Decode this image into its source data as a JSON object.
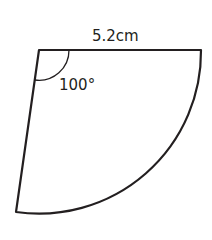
{
  "diagram": {
    "type": "circular sector",
    "radius_label": "5.2cm",
    "angle_label": "100°",
    "stroke_color": "#231f20",
    "background": "#ffffff"
  }
}
